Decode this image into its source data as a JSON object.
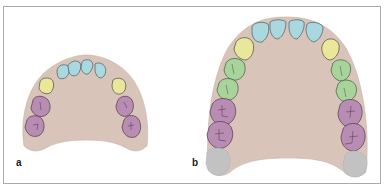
{
  "figure": {
    "panels": [
      {
        "label": "a",
        "description": "Primary (deciduous) upper dental arch",
        "teeth_groups": [
          {
            "type": "incisors",
            "count": 4,
            "color": "#a9d8df"
          },
          {
            "type": "canines",
            "count": 2,
            "color": "#e9e79a"
          },
          {
            "type": "molars",
            "count": 4,
            "color": "#b98cb3"
          }
        ]
      },
      {
        "label": "b",
        "description": "Permanent upper dental arch",
        "teeth_groups": [
          {
            "type": "incisors",
            "count": 4,
            "color": "#a9d8df"
          },
          {
            "type": "canines",
            "count": 2,
            "color": "#e9e79a"
          },
          {
            "type": "premolars",
            "count": 4,
            "color": "#a8d39a"
          },
          {
            "type": "molars",
            "count": 4,
            "color": "#b98cb3"
          },
          {
            "type": "third-molars-unerupted",
            "count": 2,
            "color": "#c2c2c2"
          }
        ]
      }
    ],
    "colors": {
      "palate": "#d8c4b9",
      "outline": "#4a4a55",
      "frame_border": "#a9a9a9"
    }
  }
}
